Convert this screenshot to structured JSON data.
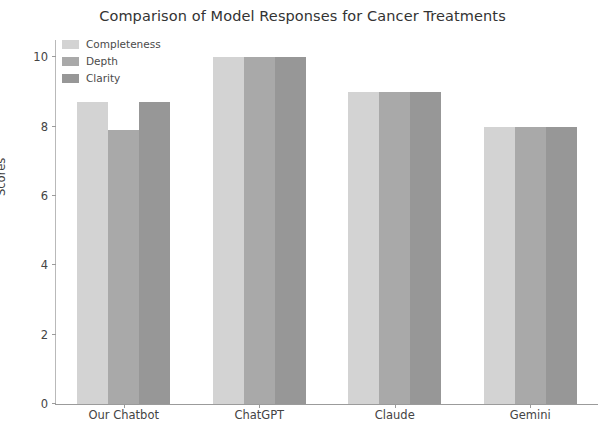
{
  "chart_data": {
    "type": "bar",
    "title": "Comparison of Model Responses for Cancer Treatments",
    "xlabel": "",
    "ylabel": "Scores",
    "categories": [
      "Our Chatbot",
      "ChatGPT",
      "Claude",
      "Gemini"
    ],
    "series": [
      {
        "name": "Completeness",
        "values": [
          8.7,
          10,
          9,
          8
        ],
        "color": "#d3d3d3"
      },
      {
        "name": "Depth",
        "values": [
          7.9,
          10,
          9,
          8
        ],
        "color": "#a9a9a9"
      },
      {
        "name": "Clarity",
        "values": [
          8.7,
          10,
          9,
          8
        ],
        "color": "#979797"
      }
    ],
    "ylim": [
      0,
      10.5
    ],
    "yticks": [
      0,
      2,
      4,
      6,
      8,
      10
    ],
    "ytick_labels": [
      "0",
      "2",
      "4",
      "6",
      "8",
      "10"
    ],
    "grid": false,
    "legend_position": "upper left"
  }
}
